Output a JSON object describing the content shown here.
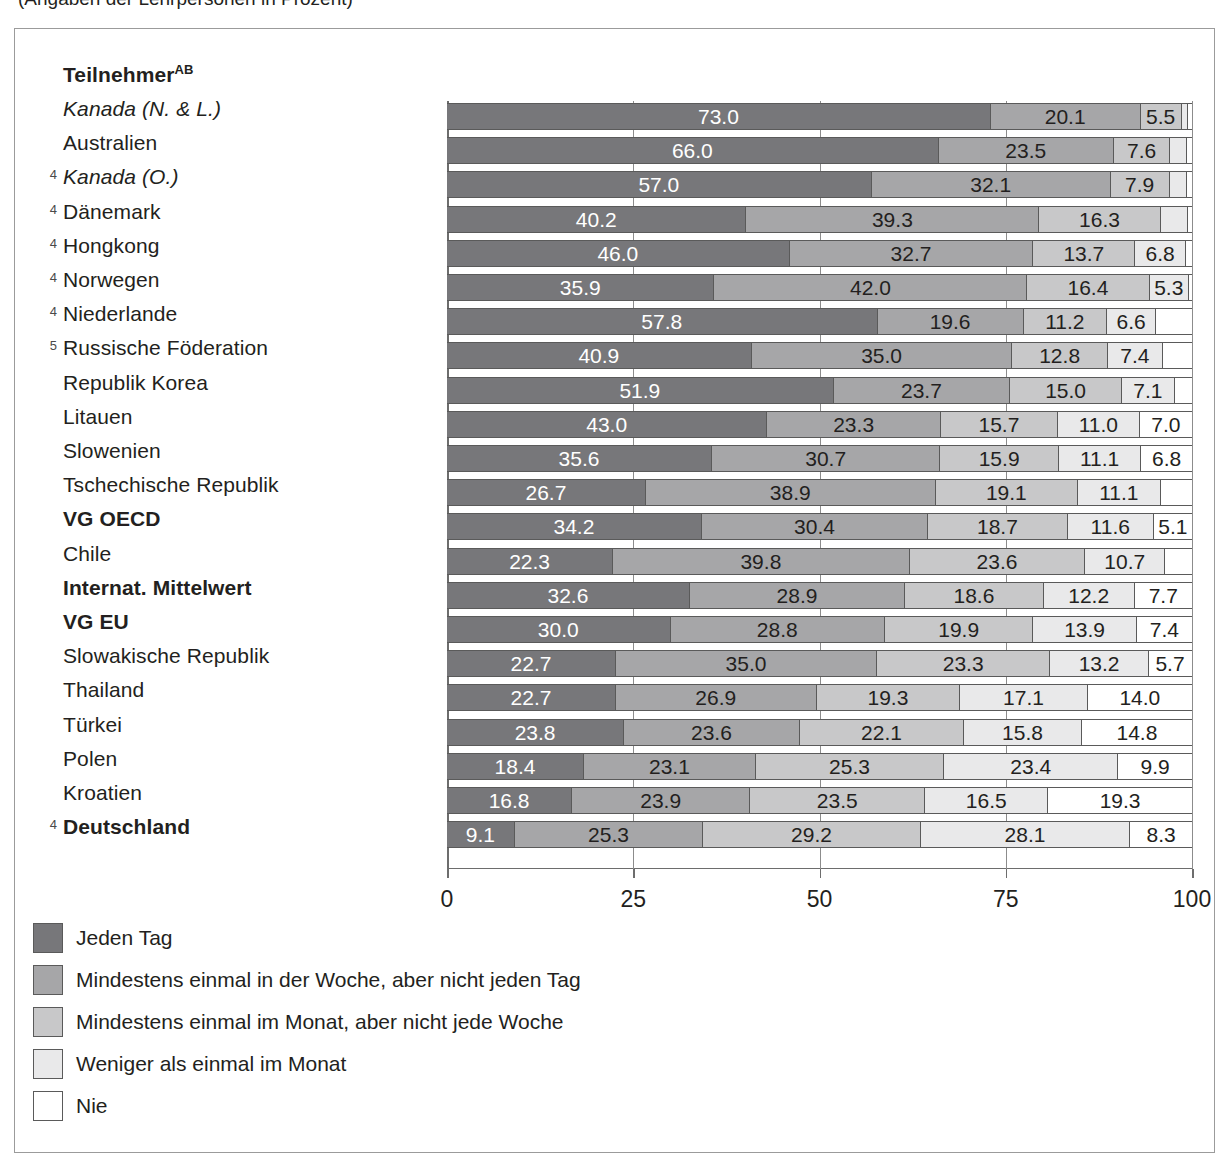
{
  "page": {
    "cut_off_caption": "(Angaben der Lehrpersonen in Prozent)"
  },
  "chart_data": {
    "type": "bar",
    "subtype": "stacked-horizontal-100pct",
    "title": "",
    "xlabel": "",
    "ylabel": "",
    "xlim": [
      0,
      100
    ],
    "xticks": [
      0,
      25,
      50,
      75,
      100
    ],
    "xticklabels": [
      "0",
      "25",
      "50",
      "75",
      "100"
    ],
    "grid": true,
    "legend_position": "below",
    "header": "Teilnehmer",
    "header_sup": "AB",
    "series": [
      {
        "name": "Jeden Tag",
        "color": "#77777a"
      },
      {
        "name": "Mindestens einmal in der Woche, aber nicht jeden Tag",
        "color": "#a6a6a8"
      },
      {
        "name": "Mindestens einmal im Monat, aber nicht jede Woche",
        "color": "#c8c8c9"
      },
      {
        "name": "Weniger als einmal im Monat",
        "color": "#e9e9ea"
      },
      {
        "name": "Nie",
        "color": "#ffffff"
      }
    ],
    "categories": [
      "Kanada (N. & L.)",
      "Australien",
      "Kanada (O.)",
      "Dänemark",
      "Hongkong",
      "Norwegen",
      "Niederlande",
      "Russische Föderation",
      "Republik Korea",
      "Litauen",
      "Slowenien",
      "Tschechische Republik",
      "VG OECD",
      "Chile",
      "Internat. Mittelwert",
      "VG EU",
      "Slowakische Republik",
      "Thailand",
      "Türkei",
      "Polen",
      "Kroatien",
      "Deutschland"
    ],
    "rows": [
      {
        "label": "Kanada (N. & L.)",
        "marker": "",
        "style": "italic",
        "values": [
          73.0,
          20.1,
          5.5,
          0.9,
          0.5
        ],
        "labels": [
          "73.0",
          "20.1",
          "5.5",
          "",
          ""
        ]
      },
      {
        "label": "Australien",
        "marker": "",
        "style": "plain",
        "values": [
          66.0,
          23.5,
          7.6,
          2.2,
          0.7
        ],
        "labels": [
          "66.0",
          "23.5",
          "7.6",
          "",
          ""
        ]
      },
      {
        "label": "Kanada (O.)",
        "marker": "4",
        "style": "italic",
        "values": [
          57.0,
          32.1,
          7.9,
          2.3,
          0.7
        ],
        "labels": [
          "57.0",
          "32.1",
          "7.9",
          "",
          ""
        ]
      },
      {
        "label": "Dänemark",
        "marker": "4",
        "style": "plain",
        "values": [
          40.2,
          39.3,
          16.3,
          3.7,
          0.5
        ],
        "labels": [
          "40.2",
          "39.3",
          "16.3",
          "",
          ""
        ]
      },
      {
        "label": "Hongkong",
        "marker": "4",
        "style": "plain",
        "values": [
          46.0,
          32.7,
          13.7,
          6.8,
          0.8
        ],
        "labels": [
          "46.0",
          "32.7",
          "13.7",
          "6.8",
          ""
        ]
      },
      {
        "label": "Norwegen",
        "marker": "4",
        "style": "plain",
        "values": [
          35.9,
          42.0,
          16.4,
          5.3,
          0.4
        ],
        "labels": [
          "35.9",
          "42.0",
          "16.4",
          "5.3",
          ""
        ]
      },
      {
        "label": "Niederlande",
        "marker": "4",
        "style": "plain",
        "values": [
          57.8,
          19.6,
          11.2,
          6.6,
          4.8
        ],
        "labels": [
          "57.8",
          "19.6",
          "11.2",
          "6.6",
          ""
        ]
      },
      {
        "label": "Russische Föderation",
        "marker": "5",
        "style": "plain",
        "values": [
          40.9,
          35.0,
          12.8,
          7.4,
          3.9
        ],
        "labels": [
          "40.9",
          "35.0",
          "12.8",
          "7.4",
          ""
        ]
      },
      {
        "label": "Republik Korea",
        "marker": "",
        "style": "plain",
        "values": [
          51.9,
          23.7,
          15.0,
          7.1,
          2.3
        ],
        "labels": [
          "51.9",
          "23.7",
          "15.0",
          "7.1",
          ""
        ]
      },
      {
        "label": "Litauen",
        "marker": "",
        "style": "plain",
        "values": [
          43.0,
          23.3,
          15.7,
          11.0,
          7.0
        ],
        "labels": [
          "43.0",
          "23.3",
          "15.7",
          "11.0",
          "7.0"
        ]
      },
      {
        "label": "Slowenien",
        "marker": "",
        "style": "plain",
        "values": [
          35.6,
          30.7,
          15.9,
          11.1,
          6.8
        ],
        "labels": [
          "35.6",
          "30.7",
          "15.9",
          "11.1",
          "6.8"
        ]
      },
      {
        "label": "Tschechische Republik",
        "marker": "",
        "style": "plain",
        "values": [
          26.7,
          38.9,
          19.1,
          11.1,
          4.2
        ],
        "labels": [
          "26.7",
          "38.9",
          "19.1",
          "11.1",
          ""
        ]
      },
      {
        "label": "VG OECD",
        "marker": "",
        "style": "bold",
        "values": [
          34.2,
          30.4,
          18.7,
          11.6,
          5.1
        ],
        "labels": [
          "34.2",
          "30.4",
          "18.7",
          "11.6",
          "5.1"
        ]
      },
      {
        "label": "Chile",
        "marker": "",
        "style": "plain",
        "values": [
          22.3,
          39.8,
          23.6,
          10.7,
          3.6
        ],
        "labels": [
          "22.3",
          "39.8",
          "23.6",
          "10.7",
          ""
        ]
      },
      {
        "label": "Internat. Mittelwert",
        "marker": "",
        "style": "bold",
        "values": [
          32.6,
          28.9,
          18.6,
          12.2,
          7.7
        ],
        "labels": [
          "32.6",
          "28.9",
          "18.6",
          "12.2",
          "7.7"
        ]
      },
      {
        "label": "VG EU",
        "marker": "",
        "style": "bold",
        "values": [
          30.0,
          28.8,
          19.9,
          13.9,
          7.4
        ],
        "labels": [
          "30.0",
          "28.8",
          "19.9",
          "13.9",
          "7.4"
        ]
      },
      {
        "label": "Slowakische Republik",
        "marker": "",
        "style": "plain",
        "values": [
          22.7,
          35.0,
          23.3,
          13.2,
          5.7
        ],
        "labels": [
          "22.7",
          "35.0",
          "23.3",
          "13.2",
          "5.7"
        ]
      },
      {
        "label": "Thailand",
        "marker": "",
        "style": "plain",
        "values": [
          22.7,
          26.9,
          19.3,
          17.1,
          14.0
        ],
        "labels": [
          "22.7",
          "26.9",
          "19.3",
          "17.1",
          "14.0"
        ]
      },
      {
        "label": "Türkei",
        "marker": "",
        "style": "plain",
        "values": [
          23.8,
          23.6,
          22.1,
          15.8,
          14.8
        ],
        "labels": [
          "23.8",
          "23.6",
          "22.1",
          "15.8",
          "14.8"
        ]
      },
      {
        "label": "Polen",
        "marker": "",
        "style": "plain",
        "values": [
          18.4,
          23.1,
          25.3,
          23.4,
          9.9
        ],
        "labels": [
          "18.4",
          "23.1",
          "25.3",
          "23.4",
          "9.9"
        ]
      },
      {
        "label": "Kroatien",
        "marker": "",
        "style": "plain",
        "values": [
          16.8,
          23.9,
          23.5,
          16.5,
          19.3
        ],
        "labels": [
          "16.8",
          "23.9",
          "23.5",
          "16.5",
          "19.3"
        ]
      },
      {
        "label": "Deutschland",
        "marker": "4",
        "style": "bold",
        "values": [
          9.1,
          25.3,
          29.2,
          28.1,
          8.3
        ],
        "labels": [
          "9.1",
          "25.3",
          "29.2",
          "28.1",
          "8.3"
        ]
      }
    ]
  }
}
